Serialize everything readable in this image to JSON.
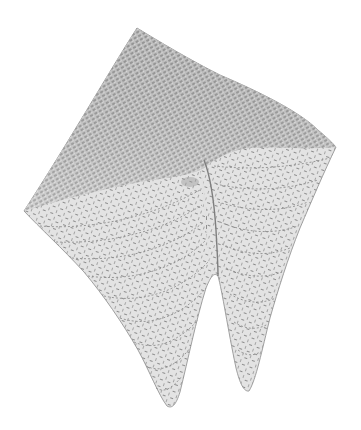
{
  "figure": {
    "kind": "3d-mesh-surface",
    "background": "#ffffff",
    "surface_color_light": "#e4e4e4",
    "surface_color_dark": "#b4b4b4",
    "mesh_line_color": "#7a7a7a",
    "features": [
      "saddle-like fold",
      "two downward lobes"
    ]
  }
}
